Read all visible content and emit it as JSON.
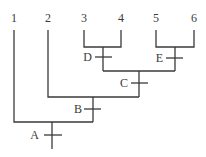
{
  "diagram": {
    "type": "cladogram",
    "leaves": [
      {
        "label": "1",
        "x": 14
      },
      {
        "label": "2",
        "x": 48
      },
      {
        "label": "3",
        "x": 84
      },
      {
        "label": "4",
        "x": 121
      },
      {
        "label": "5",
        "x": 156
      },
      {
        "label": "6",
        "x": 194
      }
    ],
    "nodes": [
      {
        "label": "D",
        "joins": [
          "3",
          "4"
        ]
      },
      {
        "label": "E",
        "joins": [
          "5",
          "6"
        ]
      },
      {
        "label": "C",
        "joins": [
          "D",
          "E"
        ]
      },
      {
        "label": "B",
        "joins": [
          "2",
          "C"
        ]
      },
      {
        "label": "A",
        "joins": [
          "1",
          "B"
        ]
      }
    ],
    "colors": {
      "line": "#3a3a3a",
      "text": "#3a3a3a",
      "background": "#ffffff"
    }
  }
}
